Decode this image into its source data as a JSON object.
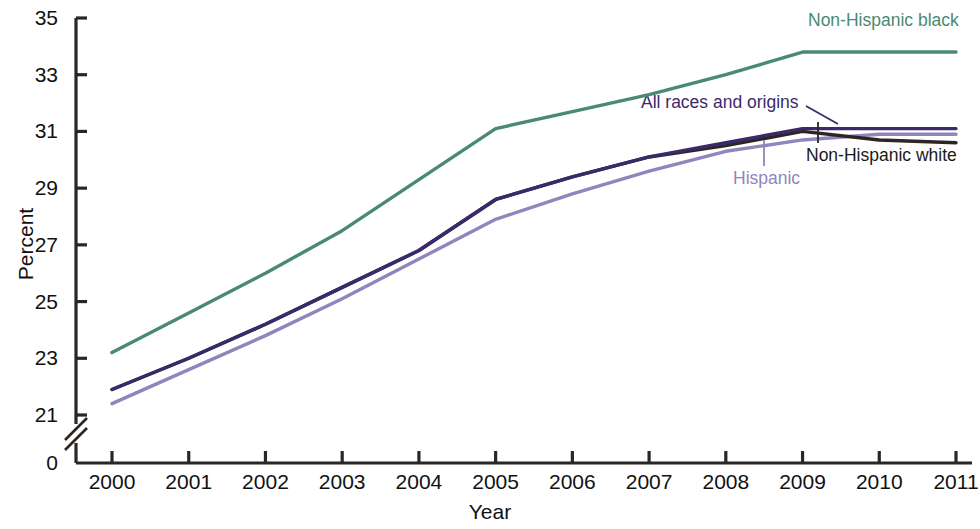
{
  "chart_data": {
    "type": "line",
    "title": "",
    "xlabel": "Year",
    "ylabel": "Percent",
    "x": [
      2000,
      2001,
      2002,
      2003,
      2004,
      2005,
      2006,
      2007,
      2008,
      2009,
      2010,
      2011
    ],
    "xtick_labels": [
      "2000",
      "2001",
      "2002",
      "2003",
      "2004",
      "2005",
      "2006",
      "2007",
      "2008",
      "2009",
      "2010",
      "2011"
    ],
    "ytick_labels": [
      "0",
      "21",
      "23",
      "25",
      "27",
      "29",
      "31",
      "33",
      "35"
    ],
    "yticks": [
      0,
      21,
      23,
      25,
      27,
      29,
      31,
      33,
      35
    ],
    "ylim": [
      21,
      35
    ],
    "axis_break": true,
    "axis_break_note": "y-axis broken between 0 and 21",
    "grid": false,
    "legend_position": "inline-annotations",
    "series": [
      {
        "name": "Non-Hispanic black",
        "color": "#4a8a74",
        "values": [
          23.2,
          24.6,
          26.0,
          27.5,
          29.3,
          31.1,
          31.7,
          32.3,
          33.0,
          33.8,
          33.8,
          33.8
        ]
      },
      {
        "name": "All races and origins",
        "color": "#3b2a6b",
        "values": [
          21.9,
          23.0,
          24.2,
          25.5,
          26.8,
          28.6,
          29.4,
          30.1,
          30.6,
          31.1,
          31.1,
          31.1
        ]
      },
      {
        "name": "Non-Hispanic white",
        "color": "#2b2622",
        "values": [
          21.9,
          23.0,
          24.2,
          25.5,
          26.8,
          28.6,
          29.4,
          30.1,
          30.5,
          31.0,
          30.7,
          30.6
        ]
      },
      {
        "name": "Hispanic",
        "color": "#8f86bd",
        "values": [
          21.4,
          22.6,
          23.8,
          25.1,
          26.5,
          27.9,
          28.8,
          29.6,
          30.3,
          30.7,
          30.9,
          30.9
        ]
      }
    ],
    "annotations": [
      {
        "text": "Non-Hispanic black",
        "color": "#4a8a74"
      },
      {
        "text": "All races and origins",
        "color": "#3b2a6b"
      },
      {
        "text": "Non-Hispanic white",
        "color": "#1a1a1a"
      },
      {
        "text": "Hispanic",
        "color": "#8f86bd"
      }
    ]
  },
  "axis_colors": {
    "axis_line": "#2b2622"
  }
}
